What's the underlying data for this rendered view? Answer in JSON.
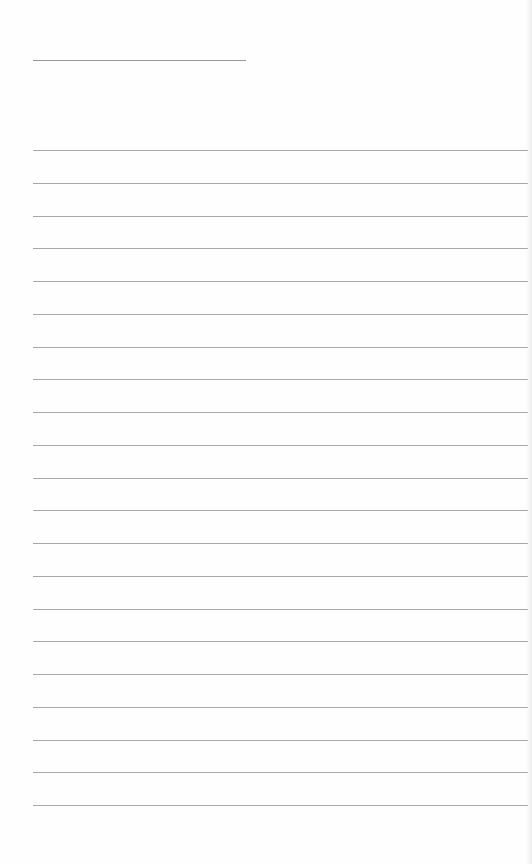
{
  "page": {
    "type": "lined-paper",
    "title_field": {
      "value": "",
      "line_width_px": 213
    },
    "rules": {
      "count": 21,
      "first_y": 150,
      "spacing": 32.75,
      "color": "#a8a8a8"
    },
    "background": "#fefefe"
  }
}
